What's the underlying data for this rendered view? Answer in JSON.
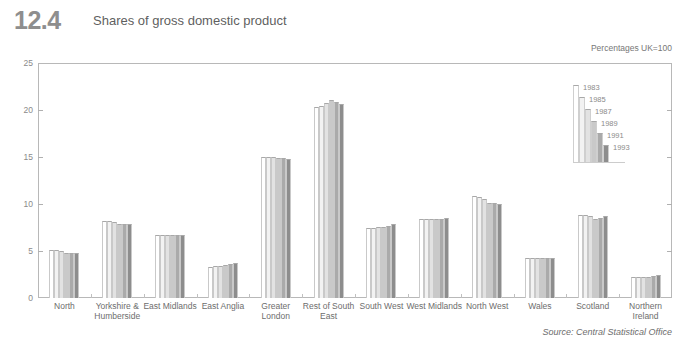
{
  "header": {
    "figure_number": "12.4",
    "title": "Shares of gross domestic product",
    "units": "Percentages UK=100",
    "source": "Source: Central Statistical Office"
  },
  "chart_data": {
    "type": "bar",
    "title": "Shares of gross domestic product",
    "subtitle": "Percentages UK=100",
    "xlabel": "",
    "ylabel": "",
    "ylim": [
      0,
      25
    ],
    "yticks": [
      0,
      5,
      10,
      15,
      20,
      25
    ],
    "grid": false,
    "legend_position": "inside-top-right",
    "categories": [
      "North",
      "Yorkshire &\nHumberside",
      "East Midlands",
      "East Anglia",
      "Greater\nLondon",
      "Rest of South\nEast",
      "South West",
      "West Midlands",
      "North West",
      "Wales",
      "Scotland",
      "Northern\nIreland"
    ],
    "series": [
      {
        "name": "1983",
        "color": "#ffffff",
        "values": [
          5.1,
          8.2,
          6.7,
          3.3,
          15.0,
          20.3,
          7.4,
          8.4,
          10.8,
          4.3,
          8.8,
          2.2
        ]
      },
      {
        "name": "1985",
        "color": "#f2f2f2",
        "values": [
          5.1,
          8.2,
          6.7,
          3.4,
          15.0,
          20.4,
          7.5,
          8.4,
          10.7,
          4.3,
          8.8,
          2.2
        ]
      },
      {
        "name": "1987",
        "color": "#e2e2e2",
        "values": [
          5.0,
          8.1,
          6.7,
          3.4,
          15.0,
          20.7,
          7.6,
          8.4,
          10.5,
          4.3,
          8.7,
          2.2
        ]
      },
      {
        "name": "1989",
        "color": "#c9c9c9",
        "values": [
          4.8,
          7.9,
          6.7,
          3.5,
          14.9,
          21.1,
          7.6,
          8.4,
          10.1,
          4.3,
          8.4,
          2.2
        ]
      },
      {
        "name": "1991",
        "color": "#aaaaaa",
        "values": [
          4.8,
          7.9,
          6.7,
          3.6,
          14.9,
          20.8,
          7.7,
          8.4,
          10.1,
          4.3,
          8.5,
          2.3
        ]
      },
      {
        "name": "1993",
        "color": "#8d8d8d",
        "values": [
          4.8,
          7.9,
          6.7,
          3.7,
          14.8,
          20.6,
          7.9,
          8.5,
          10.0,
          4.3,
          8.7,
          2.4
        ]
      }
    ]
  },
  "legend": {
    "entries": [
      "1983",
      "1985",
      "1987",
      "1989",
      "1991",
      "1993"
    ]
  },
  "axis": {
    "y_tick_labels": [
      "25",
      "20",
      "15",
      "10",
      "5",
      "0"
    ]
  }
}
